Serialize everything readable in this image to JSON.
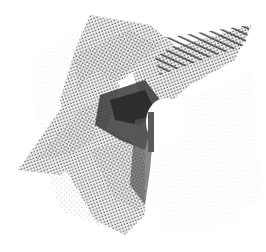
{
  "figure": {
    "background": "#ffffff",
    "colors": {
      "dark": "#2a2a2a",
      "mid": "#555555",
      "light": "#9a9a9a",
      "faint": "#d8d8d8"
    }
  }
}
